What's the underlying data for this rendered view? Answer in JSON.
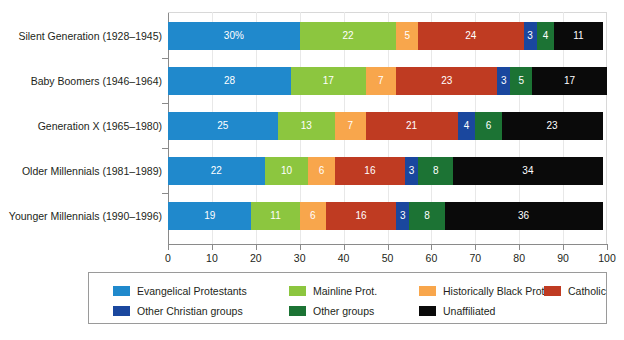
{
  "chart_data": {
    "type": "bar",
    "orientation": "horizontal",
    "stacked": true,
    "normalized": true,
    "title": "",
    "subtitle": "",
    "xlabel": "",
    "ylabel": "",
    "xlim": [
      0,
      100
    ],
    "xticks": [
      0,
      10,
      20,
      30,
      40,
      50,
      60,
      70,
      80,
      90,
      100
    ],
    "xtick_labels": [
      "0",
      "10",
      "20",
      "30",
      "40",
      "50",
      "60",
      "70",
      "80",
      "90",
      "100"
    ],
    "grid": true,
    "grid_axis": "x",
    "legend_position": "bottom",
    "categories": [
      "Silent Generation (1928–1945)",
      "Baby Boomers (1946–1964)",
      "Generation X (1965–1980)",
      "Older Millennials (1981–1989)",
      "Younger Millennials (1990–1996)"
    ],
    "series": [
      {
        "name": "Evangelical Protestants",
        "color": "#2089cc",
        "values": [
          30,
          28,
          25,
          22,
          19
        ],
        "labels": [
          "30%",
          "28",
          "25",
          "22",
          "19"
        ]
      },
      {
        "name": "Mainline Prot.",
        "color": "#8cc63f",
        "values": [
          22,
          17,
          13,
          10,
          11
        ],
        "labels": [
          "22",
          "17",
          "13",
          "10",
          "11"
        ]
      },
      {
        "name": "Historically Black Prot.",
        "color": "#f8a64c",
        "values": [
          5,
          7,
          7,
          6,
          6
        ],
        "labels": [
          "5",
          "7",
          "7",
          "6",
          "6"
        ]
      },
      {
        "name": "Catholic",
        "color": "#bf3b22",
        "values": [
          24,
          23,
          21,
          16,
          16
        ],
        "labels": [
          "24",
          "23",
          "21",
          "16",
          "16"
        ]
      },
      {
        "name": "Other Christian groups",
        "color": "#1a479e",
        "values": [
          3,
          3,
          4,
          3,
          3
        ],
        "labels": [
          "3",
          "3",
          "4",
          "3",
          "3"
        ]
      },
      {
        "name": "Other groups",
        "color": "#1c7334",
        "values": [
          4,
          5,
          6,
          8,
          8
        ],
        "labels": [
          "4",
          "5",
          "6",
          "8",
          "8"
        ]
      },
      {
        "name": "Unaffiliated",
        "color": "#0a0a0a",
        "values": [
          11,
          17,
          23,
          34,
          36
        ],
        "labels": [
          "11",
          "17",
          "23",
          "34",
          "36"
        ]
      }
    ]
  },
  "legend": {
    "items": [
      {
        "label": "Evangelical Protestants",
        "color": "#2089cc"
      },
      {
        "label": "Mainline Prot.",
        "color": "#8cc63f"
      },
      {
        "label": "Historically Black Prot.",
        "color": "#f8a64c"
      },
      {
        "label": "Catholic",
        "color": "#bf3b22"
      },
      {
        "label": "Other Christian groups",
        "color": "#1a479e"
      },
      {
        "label": "Other groups",
        "color": "#1c7334"
      },
      {
        "label": "Unaffiliated",
        "color": "#0a0a0a"
      }
    ]
  },
  "colors": {
    "background": "#ffffff",
    "axis": "#8a8a8a",
    "gridline": "#e8e8e8",
    "text": "#231f20",
    "legend_border": "#9a9a9a",
    "bar_label_text": "#ffffff"
  }
}
